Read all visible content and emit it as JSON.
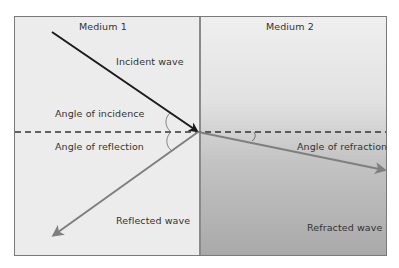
{
  "diagram": {
    "type": "wave refraction/reflection at boundary",
    "media": [
      {
        "id": "medium-1",
        "label": "Medium 1",
        "color": "#ececec"
      },
      {
        "id": "medium-2",
        "label": "Medium 2",
        "color_top": "#efefef",
        "color_bottom": "#a9a9a9"
      }
    ],
    "waves": {
      "incident": {
        "label": "Incident wave",
        "color": "#1a1a1a"
      },
      "reflected": {
        "label": "Reflected wave",
        "color": "#7f7f7f"
      },
      "refracted": {
        "label": "Refracted wave",
        "color": "#7f7f7f"
      }
    },
    "angles": {
      "incidence": "Angle of incidence",
      "reflection": "Angle of reflection",
      "refraction": "Angle of refraction"
    },
    "normal_line": "dashed"
  }
}
